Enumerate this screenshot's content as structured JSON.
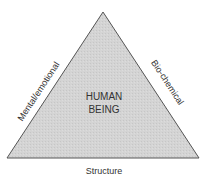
{
  "diagram": {
    "center_label_line1": "HUMAN",
    "center_label_line2": "BEING",
    "left_side_label": "Mental/emotional",
    "right_side_label": "Bio-chemical",
    "base_label": "Structure",
    "colors": {
      "fill": "#d2d2d2",
      "stroke": "#555555",
      "text": "#333333"
    }
  }
}
